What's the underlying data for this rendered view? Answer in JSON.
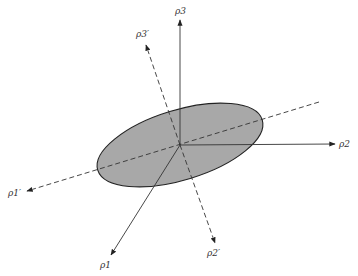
{
  "diagram": {
    "origin": [
      180,
      145
    ],
    "ellipse": {
      "cx": 180,
      "cy": 145,
      "rx": 86,
      "ry": 35,
      "rotate": -17,
      "fill": "#a8a8a8",
      "stroke": "#222222"
    },
    "axes": [
      {
        "id": "p1",
        "style": "solid",
        "from": [
          180,
          145
        ],
        "to": [
          111,
          255
        ],
        "label": "ρ1",
        "label_pos": [
          100,
          266
        ]
      },
      {
        "id": "p2",
        "style": "solid",
        "from": [
          180,
          145
        ],
        "to": [
          335,
          144
        ],
        "label": "ρ2",
        "label_pos": [
          339,
          147
        ]
      },
      {
        "id": "p3",
        "style": "solid",
        "from": [
          180,
          145
        ],
        "to": [
          180,
          20
        ],
        "label": "ρ3",
        "label_pos": [
          175,
          14
        ]
      },
      {
        "id": "p1prime",
        "style": "dashed",
        "from": [
          319,
          102
        ],
        "to": [
          27,
          191
        ],
        "label": "ρ1′",
        "label_pos": [
          8,
          196
        ]
      },
      {
        "id": "p2prime",
        "style": "dashed",
        "from": [
          180,
          145
        ],
        "to": [
          215,
          243
        ],
        "label": "ρ2′",
        "label_pos": [
          208,
          256
        ]
      },
      {
        "id": "p3prime",
        "style": "dashed",
        "from": [
          180,
          145
        ],
        "to": [
          146,
          45
        ],
        "label": "ρ3′",
        "label_pos": [
          136,
          37
        ]
      }
    ]
  }
}
